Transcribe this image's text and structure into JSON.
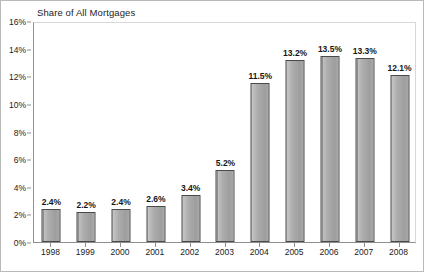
{
  "chart_data": {
    "type": "bar",
    "title": "Share of All Mortgages",
    "xlabel": "",
    "ylabel": "",
    "categories": [
      "1998",
      "1999",
      "2000",
      "2001",
      "2002",
      "2003",
      "2004",
      "2005",
      "2006",
      "2007",
      "2008"
    ],
    "values": [
      2.4,
      2.2,
      2.4,
      2.6,
      3.4,
      5.2,
      11.5,
      13.2,
      13.5,
      13.3,
      12.1
    ],
    "data_labels": [
      "2.4%",
      "2.2%",
      "2.4%",
      "2.6%",
      "3.4%",
      "5.2%",
      "11.5%",
      "13.2%",
      "13.5%",
      "13.3%",
      "12.1%"
    ],
    "ylim": [
      0,
      16
    ],
    "ytick_values": [
      0,
      2,
      4,
      6,
      8,
      10,
      12,
      14,
      16
    ],
    "ytick_labels": [
      "0%",
      "2%",
      "4%",
      "6%",
      "8%",
      "10%",
      "12%",
      "14%",
      "16%"
    ],
    "grid": false,
    "legend": null,
    "bar_color": "#a3a3a3",
    "bar_border_color": "#4a4a4a",
    "axis_color": "#8f8f8f",
    "text_color": "#222222",
    "background_color": "#ffffff",
    "frame_border_color": "#b9b9b9"
  }
}
